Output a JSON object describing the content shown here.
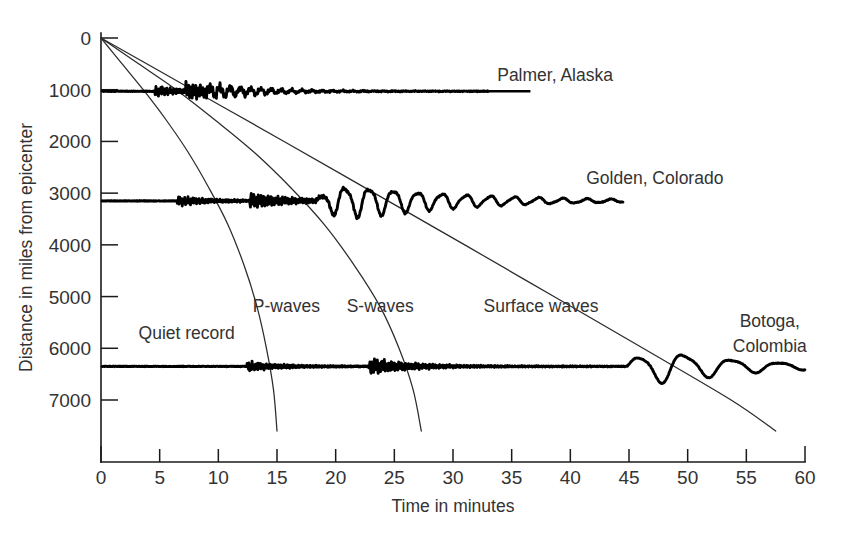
{
  "chart_data": {
    "type": "line",
    "title": "",
    "xlabel": "Time in minutes",
    "ylabel": "Distance in miles from epicenter",
    "xlim": [
      0,
      60
    ],
    "ylim": [
      0,
      7800
    ],
    "grid": false,
    "legend_position": "inline-annotations",
    "x_ticks": [
      "0",
      "5",
      "10",
      "15",
      "20",
      "25",
      "30",
      "35",
      "40",
      "45",
      "50",
      "55",
      "60"
    ],
    "x_tick_values": [
      0,
      5,
      10,
      15,
      20,
      25,
      30,
      35,
      40,
      45,
      50,
      55,
      60
    ],
    "y_ticks": [
      "0",
      "1000",
      "2000",
      "3000",
      "4000",
      "5000",
      "6000",
      "7000"
    ],
    "y_tick_values": [
      0,
      1000,
      2000,
      3000,
      4000,
      5000,
      6000,
      7000
    ],
    "travel_time_curves": [
      {
        "name": "P-waves",
        "label": "P-waves",
        "label_x": 15.8,
        "label_y": 5300,
        "points": [
          [
            0,
            0
          ],
          [
            1.8,
            500
          ],
          [
            3.6,
            1000
          ],
          [
            5.6,
            1600
          ],
          [
            7.4,
            2200
          ],
          [
            9.2,
            2900
          ],
          [
            10.8,
            3600
          ],
          [
            12.2,
            4400
          ],
          [
            13.3,
            5200
          ],
          [
            14.1,
            6000
          ],
          [
            14.7,
            6800
          ],
          [
            15.0,
            7600
          ]
        ]
      },
      {
        "name": "S-waves",
        "label": "S-waves",
        "label_x": 23.8,
        "label_y": 5300,
        "points": [
          [
            0,
            0
          ],
          [
            3.2,
            500
          ],
          [
            6.4,
            1000
          ],
          [
            9.8,
            1600
          ],
          [
            13.0,
            2200
          ],
          [
            16.2,
            2900
          ],
          [
            19.0,
            3600
          ],
          [
            21.6,
            4400
          ],
          [
            23.8,
            5200
          ],
          [
            25.4,
            6000
          ],
          [
            26.6,
            6800
          ],
          [
            27.3,
            7600
          ]
        ]
      },
      {
        "name": "Surface waves",
        "label": "Surface waves",
        "label_x": 37.5,
        "label_y": 5300,
        "points": [
          [
            0,
            0
          ],
          [
            7.8,
            1000
          ],
          [
            15.6,
            2000
          ],
          [
            23.3,
            3000
          ],
          [
            31.0,
            4000
          ],
          [
            38.6,
            5000
          ],
          [
            46.2,
            6000
          ],
          [
            53.7,
            7000
          ],
          [
            57.5,
            7600
          ]
        ]
      }
    ],
    "seismograms": [
      {
        "name": "Palmer, Alaska",
        "label": "Palmer, Alaska",
        "baseline_distance": 1030,
        "label_x": 38.7,
        "label_y": 830,
        "leader_from_x": 32.0,
        "leader_to_x": 36.6,
        "p_arrival": 4.6,
        "s_arrival": 7.2,
        "surface_arrival": 8.2,
        "trace_start": 0.1,
        "trace_end": 33.0
      },
      {
        "name": "Golden, Colorado",
        "label": "Golden, Colorado",
        "baseline_distance": 3150,
        "label_x": 47.2,
        "label_y": 2830,
        "p_arrival": 6.5,
        "s_arrival": 12.6,
        "surface_arrival": 18.3,
        "trace_start": 0.1,
        "trace_end": 44.5
      },
      {
        "name": "Botoga, Colombia",
        "label_line1": "Botoga,",
        "label_line2": "Colombia",
        "label_x": 57.0,
        "label_y1": 5580,
        "label_y2": 6080,
        "baseline_distance": 6350,
        "p_arrival": 12.4,
        "s_arrival": 22.8,
        "surface_arrival": 44.8,
        "trace_start": 0.1,
        "trace_end": 60.0
      }
    ],
    "annotations": [
      {
        "name": "quiet-record",
        "text": "Quiet record",
        "x": 3.2,
        "y": 5830
      }
    ]
  },
  "figure": {
    "background_color": "#ffffff",
    "line_color": "#000000",
    "axis_color": "#1a1a1a",
    "text_color": "#333333"
  }
}
